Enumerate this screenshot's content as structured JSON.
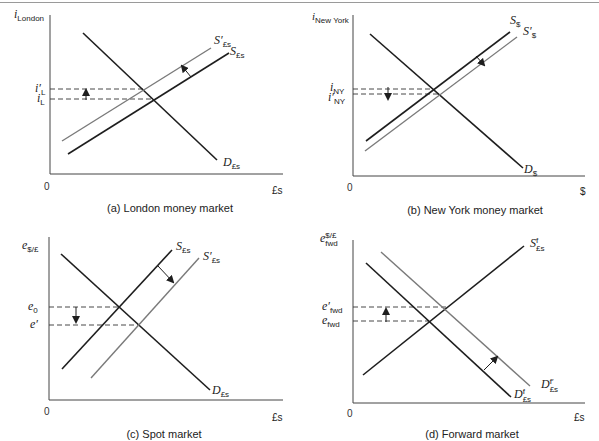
{
  "colors": {
    "dark_line": "#1e1e1e",
    "light_line": "#7a7a7a",
    "dash": "#333333",
    "text": "#222222"
  },
  "panels": {
    "a": {
      "caption": "(a) London money market",
      "y_axis": {
        "var": "i",
        "sub": "London"
      },
      "x_axis": "£s",
      "origin": "0",
      "levels": [
        {
          "var": "i′",
          "sub": "L"
        },
        {
          "var": "i",
          "sub": "L"
        }
      ],
      "curves": {
        "demand": {
          "var": "D",
          "sub": "£s"
        },
        "supply": {
          "var": "S",
          "sub": "£s"
        },
        "supply_new": {
          "var": "S′",
          "sub": "£s"
        }
      }
    },
    "b": {
      "caption": "(b) New York money market",
      "y_axis": {
        "var": "i",
        "sub": "New York"
      },
      "x_axis": "$",
      "origin": "0",
      "levels": [
        {
          "var": "i",
          "sub": "NY"
        },
        {
          "var": "i′",
          "sub": "NY"
        }
      ],
      "curves": {
        "demand": {
          "var": "D",
          "sub": "$"
        },
        "supply": {
          "var": "S",
          "sub": "$"
        },
        "supply_new": {
          "var": "S′",
          "sub": "$"
        }
      }
    },
    "c": {
      "caption": "(c) Spot market",
      "y_axis": {
        "var": "e",
        "sub": "$/£"
      },
      "x_axis": "£s",
      "origin": "0",
      "levels": [
        {
          "var": "e",
          "sub": "0"
        },
        {
          "var": "e′",
          "sub": ""
        }
      ],
      "curves": {
        "demand": {
          "var": "D",
          "sub": "£s"
        },
        "supply": {
          "var": "S",
          "sub": "£s"
        },
        "supply_new": {
          "var": "S′",
          "sub": "£s"
        }
      }
    },
    "d": {
      "caption": "(d) Forward market",
      "y_axis": {
        "var": "e",
        "sup": "$/£",
        "sub": "fwd"
      },
      "x_axis": "£s",
      "origin": "0",
      "levels": [
        {
          "var": "e′",
          "sub": "fwd"
        },
        {
          "var": "e",
          "sub": "fwd"
        }
      ],
      "curves": {
        "supply": {
          "var": "S",
          "sup": "f",
          "sub": "£s"
        },
        "demand": {
          "var": "D",
          "sup": "f",
          "sub": "£s"
        },
        "demand_new": {
          "var": "D",
          "sup": "f′",
          "sub": "£s"
        }
      }
    }
  }
}
